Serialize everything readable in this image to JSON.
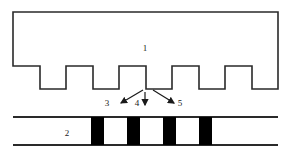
{
  "figure": {
    "background_color": "#ffffff",
    "line_color": "#2a2a2a",
    "fill_color": "#000000",
    "label_color": "#1a1a1a",
    "width": 290,
    "height": 157
  },
  "callouts": {
    "body_label": "1",
    "bar_label": "2",
    "left_arrow_label": "3",
    "center_arrow_label": "4",
    "right_arrow_label": "5"
  },
  "upper_part": {
    "name": "castellated-body",
    "left": 13,
    "right": 278,
    "top": 12,
    "baseline": 89,
    "tooth_top": 66,
    "tooth_count": 5,
    "notch_count": 5,
    "tooth_width": 26,
    "notch_width": 27,
    "pitch": 53
  },
  "lower_part": {
    "name": "striped-bar",
    "left": 13,
    "right": 278,
    "top": 117,
    "bottom": 145,
    "stripe_color": "#000000",
    "stripe_count": 4,
    "stripe_width": 13,
    "stripe_pitch": 36,
    "stripe_x_positions": [
      91,
      127,
      163,
      199
    ]
  },
  "arrows": [
    {
      "name": "arrow-3",
      "label": "3",
      "from_x": 143,
      "from_y": 90,
      "to_x": 120,
      "to_y": 104,
      "label_x": 107,
      "label_y": 104
    },
    {
      "name": "arrow-4",
      "label": "4",
      "from_x": 145,
      "from_y": 93,
      "to_x": 145,
      "to_y": 106,
      "label_x": 137,
      "label_y": 104
    },
    {
      "name": "arrow-5",
      "label": "5",
      "from_x": 152,
      "from_y": 90,
      "to_x": 175,
      "to_y": 104,
      "label_x": 179,
      "label_y": 104
    }
  ]
}
